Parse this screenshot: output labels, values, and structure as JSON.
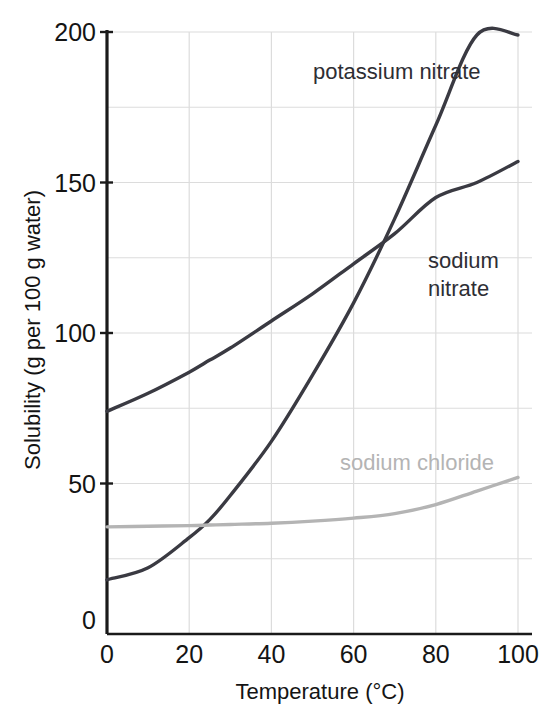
{
  "chart_data": {
    "type": "line",
    "title": "",
    "xlabel": "Temperature (°C)",
    "ylabel": "Solubility (g per 100 g water)",
    "xlim": [
      0,
      100
    ],
    "ylim": [
      0,
      200
    ],
    "xticks": [
      0,
      20,
      40,
      60,
      80,
      100
    ],
    "yticks": [
      0,
      50,
      100,
      150,
      200
    ],
    "xtick_labels": [
      "0",
      "20",
      "40",
      "60",
      "80",
      "100"
    ],
    "ytick_labels": [
      "0",
      "50",
      "100",
      "150",
      "200"
    ],
    "grid": true,
    "grid_x_step": 20,
    "grid_y_step": 25,
    "legend_position": "inline-labels",
    "x": [
      0,
      10,
      20,
      25,
      30,
      40,
      50,
      60,
      70,
      80,
      90,
      100
    ],
    "series": [
      {
        "name": "potassium nitrate",
        "color": "#3a3a42",
        "label_x": 53,
        "label_y": 185,
        "values": [
          18,
          22,
          32,
          38,
          46,
          64,
          86,
          110,
          138,
          169,
          202,
          246
        ],
        "clipped_at": 200,
        "values_clipped": [
          18,
          22,
          32,
          38,
          46,
          64,
          86,
          110,
          138,
          169,
          199,
          199
        ]
      },
      {
        "name": "sodium nitrate",
        "color": "#3a3a42",
        "label_x": 84,
        "label_y": 120,
        "values": [
          74,
          80,
          87,
          91,
          95,
          104,
          113,
          123,
          133,
          145,
          150,
          157
        ]
      },
      {
        "name": "sodium chloride",
        "color": "#b4b4b4",
        "label_x": 57,
        "label_y": 62,
        "values": [
          35.6,
          35.8,
          36.0,
          36.2,
          36.4,
          36.8,
          37.5,
          38.5,
          40.0,
          43.0,
          47.5,
          52.0
        ]
      }
    ],
    "annotations": [
      {
        "name": "kno3-nano3-crossing",
        "x": 78,
        "y": 122
      },
      {
        "name": "kno3-nacl-crossing",
        "x": 24,
        "y": 37
      }
    ]
  },
  "labels": {
    "potassium_nitrate": "potassium nitrate",
    "sodium_nitrate_line1": "sodium",
    "sodium_nitrate_line2": "nitrate",
    "sodium_chloride": "sodium chloride"
  },
  "axes": {
    "x_title": "Temperature (°C)",
    "y_title": "Solubility (g per 100 g water)",
    "y_origin_label": "0"
  },
  "colors": {
    "dark_curve": "#3a3a42",
    "light_curve": "#b4b4b4",
    "grid": "#dcdcdc",
    "axis": "#1a1a1a",
    "background": "#ffffff"
  }
}
